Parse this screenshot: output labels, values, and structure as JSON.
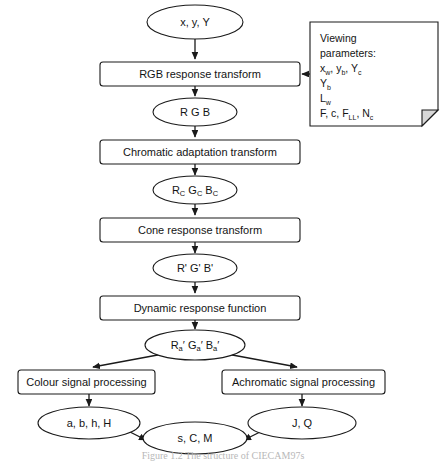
{
  "diagram": {
    "nodes": [
      {
        "id": "input-xyY",
        "kind": "ellipse",
        "label": "x, y, Y",
        "cx": 195,
        "cy": 22,
        "rx": 48,
        "ry": 17
      },
      {
        "id": "rgb-response",
        "kind": "box",
        "label": "RGB response transform",
        "x": 100,
        "y": 62,
        "w": 200,
        "h": 24
      },
      {
        "id": "rgb",
        "kind": "ellipse",
        "label": "R G B",
        "cx": 195,
        "cy": 112,
        "rx": 42,
        "ry": 14
      },
      {
        "id": "chromatic-adaptation",
        "kind": "box",
        "label": "Chromatic adaptation transform",
        "x": 100,
        "y": 140,
        "w": 200,
        "h": 24
      },
      {
        "id": "rgb-c",
        "kind": "ellipse",
        "label": "Rc Gc Bc",
        "cx": 195,
        "cy": 190,
        "rx": 42,
        "ry": 14
      },
      {
        "id": "cone-response",
        "kind": "box",
        "label": "Cone response transform",
        "x": 100,
        "y": 218,
        "w": 200,
        "h": 24
      },
      {
        "id": "rgb-prime",
        "kind": "ellipse",
        "label": "R' G' B'",
        "cx": 195,
        "cy": 268,
        "rx": 42,
        "ry": 14
      },
      {
        "id": "dynamic-response",
        "kind": "box",
        "label": "Dynamic response function",
        "x": 100,
        "y": 296,
        "w": 200,
        "h": 24
      },
      {
        "id": "rgb-a-prime",
        "kind": "ellipse",
        "label": "Ra' Ga' Ba'",
        "cx": 195,
        "cy": 345,
        "rx": 50,
        "ry": 15
      },
      {
        "id": "colour-signal",
        "kind": "box",
        "label": "Colour signal processing",
        "x": 18,
        "y": 370,
        "w": 137,
        "h": 24
      },
      {
        "id": "achromatic-signal",
        "kind": "box",
        "label": "Achromatic signal processing",
        "x": 222,
        "y": 370,
        "w": 163,
        "h": 24
      },
      {
        "id": "abhH",
        "kind": "ellipse",
        "label": "a, b, h, H",
        "cx": 89,
        "cy": 423,
        "rx": 51,
        "ry": 16
      },
      {
        "id": "sCM",
        "kind": "ellipse",
        "label": "s, C, M",
        "cx": 195,
        "cy": 438,
        "rx": 52,
        "ry": 16
      },
      {
        "id": "JQ",
        "kind": "ellipse",
        "label": "J, Q",
        "cx": 302,
        "cy": 423,
        "rx": 54,
        "ry": 16
      }
    ],
    "subscripted_labels": {
      "rgb-c": [
        {
          "base": "R",
          "sub": "C"
        },
        {
          "base": "G",
          "sub": "C"
        },
        {
          "base": "B",
          "sub": "C"
        }
      ],
      "rgb-a-prime": [
        {
          "base": "R",
          "sub": "a",
          "prime": "′"
        },
        {
          "base": "G",
          "sub": "a",
          "prime": "′"
        },
        {
          "base": "B",
          "sub": "a",
          "prime": "′"
        }
      ]
    },
    "note": {
      "id": "viewing-parameters-note",
      "x": 310,
      "y": 22,
      "w": 128,
      "h": 104,
      "fold": 16,
      "lines": [
        {
          "text": "Viewing"
        },
        {
          "text": "parameters:"
        },
        {
          "parts": [
            {
              "base": "x",
              "sub": "w"
            },
            {
              "plain": ", "
            },
            {
              "base": "y",
              "sub": "b"
            },
            {
              "plain": ", "
            },
            {
              "base": "Y",
              "sub": "c"
            }
          ]
        },
        {
          "parts": [
            {
              "base": "Y",
              "sub": "b"
            }
          ]
        },
        {
          "parts": [
            {
              "base": "L",
              "sub": "w"
            }
          ]
        },
        {
          "parts": [
            {
              "plain": "F, c, "
            },
            {
              "base": "F",
              "sub": "LL"
            },
            {
              "plain": ", "
            },
            {
              "base": "N",
              "sub": "c"
            }
          ]
        }
      ]
    },
    "edges": [
      {
        "id": "e-xyY-rgbresponse",
        "from": "input-xyY",
        "to": "rgb-response",
        "type": "arrow-down",
        "x": 195,
        "y1": 39,
        "y2": 60
      },
      {
        "id": "e-rgbresponse-rgb",
        "from": "rgb-response",
        "to": "rgb",
        "type": "arrow-down",
        "x": 195,
        "y1": 86,
        "y2": 96
      },
      {
        "id": "e-rgb-chromatic",
        "from": "rgb",
        "to": "chromatic-adaptation",
        "type": "arrow-down",
        "x": 195,
        "y1": 126,
        "y2": 138
      },
      {
        "id": "e-chromatic-rgbc",
        "from": "chromatic-adaptation",
        "to": "rgb-c",
        "type": "arrow-down",
        "x": 195,
        "y1": 164,
        "y2": 175
      },
      {
        "id": "e-rgbc-cone",
        "from": "rgb-c",
        "to": "cone-response",
        "type": "arrow-down",
        "x": 195,
        "y1": 204,
        "y2": 216
      },
      {
        "id": "e-cone-rgbprime",
        "from": "cone-response",
        "to": "rgb-prime",
        "type": "arrow-down",
        "x": 195,
        "y1": 242,
        "y2": 253
      },
      {
        "id": "e-rgbprime-dynamic",
        "from": "rgb-prime",
        "to": "dynamic-response",
        "type": "arrow-down",
        "x": 195,
        "y1": 282,
        "y2": 294
      },
      {
        "id": "e-dynamic-rgbaprime",
        "from": "dynamic-response",
        "to": "rgb-a-prime",
        "type": "arrow-down",
        "x": 195,
        "y1": 320,
        "y2": 329
      },
      {
        "id": "e-note-rgbresponse",
        "from": "viewing-parameters-note",
        "to": "rgb-response",
        "type": "arrow-left",
        "x1": 309,
        "x2": 302,
        "y": 74
      },
      {
        "id": "e-rgbaprime-colour",
        "from": "rgb-a-prime",
        "to": "colour-signal",
        "type": "arrow-diag",
        "x1": 163,
        "y1": 354,
        "x2": 92,
        "y2": 368
      },
      {
        "id": "e-rgbaprime-achromatic",
        "from": "rgb-a-prime",
        "to": "achromatic-signal",
        "type": "arrow-diag",
        "x1": 227,
        "y1": 354,
        "x2": 298,
        "y2": 368
      },
      {
        "id": "e-colour-abhH",
        "from": "colour-signal",
        "to": "abhH",
        "type": "arrow-down",
        "x": 89,
        "y1": 394,
        "y2": 406
      },
      {
        "id": "e-achromatic-JQ",
        "from": "achromatic-signal",
        "to": "JQ",
        "type": "arrow-down",
        "x": 302,
        "y1": 394,
        "y2": 406
      },
      {
        "id": "e-abhH-sCM",
        "from": "abhH",
        "to": "sCM",
        "type": "arrow-diag",
        "x1": 129,
        "y1": 432,
        "x2": 147,
        "y2": 441
      },
      {
        "id": "e-JQ-sCM",
        "from": "JQ",
        "to": "sCM",
        "type": "arrow-diag",
        "x1": 261,
        "y1": 432,
        "x2": 243,
        "y2": 441
      }
    ]
  },
  "caption": {
    "text": "Figure 1.2   The structure of CIECAM97s"
  }
}
